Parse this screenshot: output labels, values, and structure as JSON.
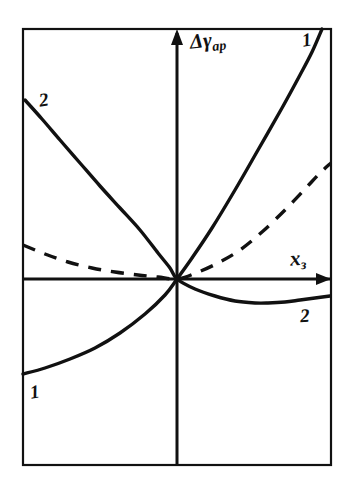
{
  "figure": {
    "background_color": "#ffffff",
    "line_color": "#111111",
    "frame": {
      "x": 23,
      "y": 29,
      "width": 308,
      "height": 436
    }
  },
  "axes": {
    "y_axis": {
      "label": "Δγ",
      "subscript": "ар",
      "x_px": 177,
      "arrow": "up"
    },
    "x_axis": {
      "label": "x",
      "subscript": "з",
      "y_px": 279,
      "arrow": "right"
    },
    "origin": {
      "x_px": 177,
      "y_px": 279
    }
  },
  "curve_labels": [
    {
      "id": "curve1-top",
      "text": "1"
    },
    {
      "id": "curve1-bottom",
      "text": "1"
    },
    {
      "id": "curve2-top",
      "text": "2"
    },
    {
      "id": "curve2-bottom",
      "text": "2"
    }
  ],
  "chart_data": {
    "type": "line",
    "title": "",
    "xlabel": "xз",
    "ylabel": "Δγар",
    "grid": false,
    "legend": "inline-curve-labels",
    "axis_style": "arrowed-axes-through-origin",
    "xlim_px": [
      23,
      331
    ],
    "ylim_px": [
      29,
      465
    ],
    "origin_px": [
      177,
      279
    ],
    "series": [
      {
        "name": "1",
        "style": "solid",
        "description": "Monotonically increasing upward-curving branch passing through the origin; negative below the x-axis on the left, steeply positive on the right.",
        "points_px": [
          [
            23,
            374
          ],
          [
            45,
            368
          ],
          [
            70,
            359
          ],
          [
            95,
            348
          ],
          [
            120,
            333
          ],
          [
            145,
            314
          ],
          [
            165,
            295
          ],
          [
            177,
            279
          ],
          [
            192,
            258
          ],
          [
            212,
            228
          ],
          [
            235,
            190
          ],
          [
            258,
            150
          ],
          [
            282,
            108
          ],
          [
            300,
            75
          ],
          [
            312,
            52
          ],
          [
            322,
            29
          ]
        ]
      },
      {
        "name": "2",
        "style": "solid",
        "description": "Decreasing branch from upper-left through the origin, dipping to a minimum below the axis on the right and then rising slightly.",
        "points_px": [
          [
            25,
            100
          ],
          [
            42,
            119
          ],
          [
            60,
            140
          ],
          [
            80,
            163
          ],
          [
            100,
            186
          ],
          [
            120,
            208
          ],
          [
            140,
            230
          ],
          [
            158,
            253
          ],
          [
            170,
            268
          ],
          [
            177,
            279
          ],
          [
            195,
            289
          ],
          [
            215,
            296
          ],
          [
            235,
            301
          ],
          [
            255,
            303
          ],
          [
            268,
            303
          ],
          [
            285,
            302
          ],
          [
            300,
            300
          ],
          [
            315,
            298
          ],
          [
            330,
            296
          ]
        ]
      },
      {
        "name": "dashed",
        "style": "dashed",
        "description": "Shallow reference curve: nearly flat slightly above the axis on the left, passing through the origin, rising moderately on the right.",
        "points_px": [
          [
            23,
            245
          ],
          [
            45,
            254
          ],
          [
            68,
            262
          ],
          [
            92,
            268
          ],
          [
            115,
            272
          ],
          [
            138,
            275
          ],
          [
            158,
            277
          ],
          [
            177,
            279
          ],
          [
            196,
            273
          ],
          [
            218,
            263
          ],
          [
            240,
            250
          ],
          [
            262,
            232
          ],
          [
            285,
            210
          ],
          [
            305,
            189
          ],
          [
            320,
            173
          ],
          [
            331,
            163
          ]
        ]
      }
    ]
  }
}
